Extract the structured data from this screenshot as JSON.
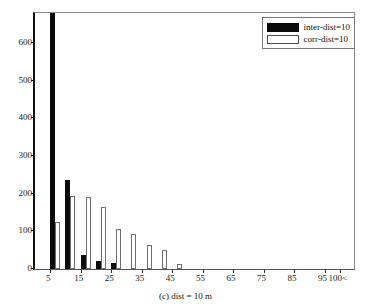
{
  "chart_data": {
    "type": "bar",
    "title": "",
    "subtitle": "",
    "caption": "(c) dist = 10 m",
    "xlabel": "",
    "ylabel": "",
    "xlim": [
      0,
      105
    ],
    "ylim": [
      0,
      680
    ],
    "grid": false,
    "legend_position": "top-right",
    "y_ticks": [
      0,
      100,
      200,
      300,
      400,
      500,
      600
    ],
    "y_tick_labels": [
      "0",
      "100",
      "200",
      "300",
      "400",
      "500",
      "600"
    ],
    "x_ticks": [
      5,
      15,
      25,
      35,
      45,
      55,
      65,
      75,
      85,
      95,
      100
    ],
    "x_tick_labels": [
      "5",
      "15",
      "25",
      "35",
      "45",
      "55",
      "65",
      "75",
      "85",
      "95",
      "100<"
    ],
    "categories": [
      5,
      10,
      15,
      20,
      25,
      30,
      35,
      40,
      45,
      50,
      55,
      60,
      65,
      70,
      75,
      80,
      85,
      90,
      95,
      100
    ],
    "series": [
      {
        "name": "inter-dist=10",
        "color": "#0b0b0b",
        "filled": true,
        "clipped_first_bar": true,
        "values": [
          690,
          236,
          37,
          22,
          16,
          0,
          0,
          0,
          0,
          0,
          0,
          0,
          0,
          0,
          0,
          0,
          0,
          0,
          0,
          0
        ]
      },
      {
        "name": "corr-dist=10",
        "color": "#ffffff",
        "filled": false,
        "clipped_first_bar": false,
        "values": [
          125,
          193,
          190,
          166,
          107,
          94,
          64,
          50,
          13,
          0,
          0,
          0,
          0,
          0,
          0,
          0,
          0,
          0,
          0,
          0
        ]
      }
    ]
  },
  "legend": {
    "items": [
      {
        "label": "inter-dist=10"
      },
      {
        "label": "corr-dist=10"
      }
    ]
  }
}
